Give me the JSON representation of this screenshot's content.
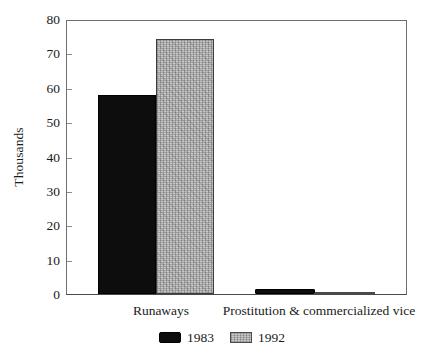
{
  "chart_data": {
    "type": "bar",
    "title": "",
    "subtitle": "",
    "xlabel": "",
    "ylabel": "Thousands",
    "categories": [
      "Runaways",
      "Prostitution & commercialized vice"
    ],
    "series": [
      {
        "name": "1983",
        "color": "#0d0d0d",
        "values": [
          58,
          1.4
        ]
      },
      {
        "name": "1992",
        "color": "#c9c9c9",
        "values": [
          74.5,
          0.7
        ]
      }
    ],
    "ylim": [
      0,
      80
    ],
    "ytick_values": [
      0,
      10,
      20,
      30,
      40,
      50,
      60,
      70,
      80
    ],
    "ytick_labels": [
      "0",
      "10",
      "20",
      "30",
      "40",
      "50",
      "60",
      "70",
      "80"
    ],
    "grid": false,
    "legend_position": "bottom",
    "legend_entries": [
      "1983",
      "1992"
    ]
  },
  "axis": {
    "y_label": "Thousands",
    "y_ticks": [
      "80",
      "70",
      "60",
      "50",
      "40",
      "30",
      "20",
      "10",
      "0"
    ]
  },
  "x_categories": [
    {
      "label": "Runaways"
    },
    {
      "label": "Prostitution & commercialized vice"
    }
  ],
  "legend": {
    "items": [
      {
        "label": "1983",
        "swatch": "black-swatch-icon"
      },
      {
        "label": "1992",
        "swatch": "gray-swatch-icon"
      }
    ]
  },
  "colors": {
    "series_1983": "#0d0d0d",
    "series_1992": "#c9c9c9",
    "axis": "#4a4a4a",
    "text": "#1a1a1a",
    "background": "#ffffff"
  }
}
